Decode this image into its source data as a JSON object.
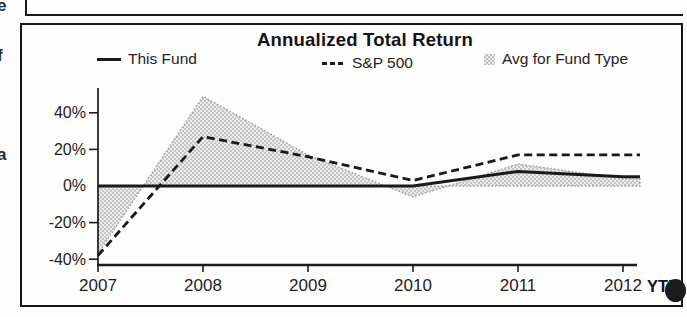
{
  "margin_fragments": {
    "letter_1": "e",
    "letter_2": "f",
    "letter_3": "a"
  },
  "chart": {
    "title": "Annualized Total Return",
    "legend": [
      {
        "label": "This Fund",
        "swatch": "solid-line"
      },
      {
        "label": "S&P 500",
        "swatch": "dashed-line"
      },
      {
        "label": "Avg for Fund Type",
        "swatch": "shaded-area"
      }
    ],
    "y_ticks": [
      "40%",
      "20%",
      "0%",
      "-20%",
      "-40%"
    ],
    "x_ticks": [
      "2007",
      "2008",
      "2009",
      "2010",
      "2011",
      "2012"
    ],
    "ytd_label": "YTD"
  },
  "chart_data": {
    "type": "line",
    "title": "Annualized Total Return",
    "categories": [
      "2007",
      "2008",
      "2009",
      "2010",
      "2011",
      "2012 YTD"
    ],
    "series": [
      {
        "name": "This Fund",
        "style": "solid",
        "color": "#1a1a1a",
        "values": [
          0,
          0,
          0,
          0,
          8,
          5
        ]
      },
      {
        "name": "S&P 500",
        "style": "dashed",
        "color": "#1a1a1a",
        "values": [
          -38,
          27,
          16,
          3,
          17,
          17
        ]
      },
      {
        "name": "Avg for Fund Type",
        "style": "area",
        "fill_color": "#d9d9d9",
        "edge_color": "#9e9e9e",
        "values": [
          -37,
          49,
          17,
          -6,
          12,
          4
        ]
      }
    ],
    "xlabel": "",
    "ylabel": "",
    "y_tick_values": [
      40,
      20,
      0,
      -20,
      -40
    ],
    "ylim": [
      -44,
      54
    ],
    "grid": false,
    "legend_position": "top",
    "unit": "%"
  }
}
